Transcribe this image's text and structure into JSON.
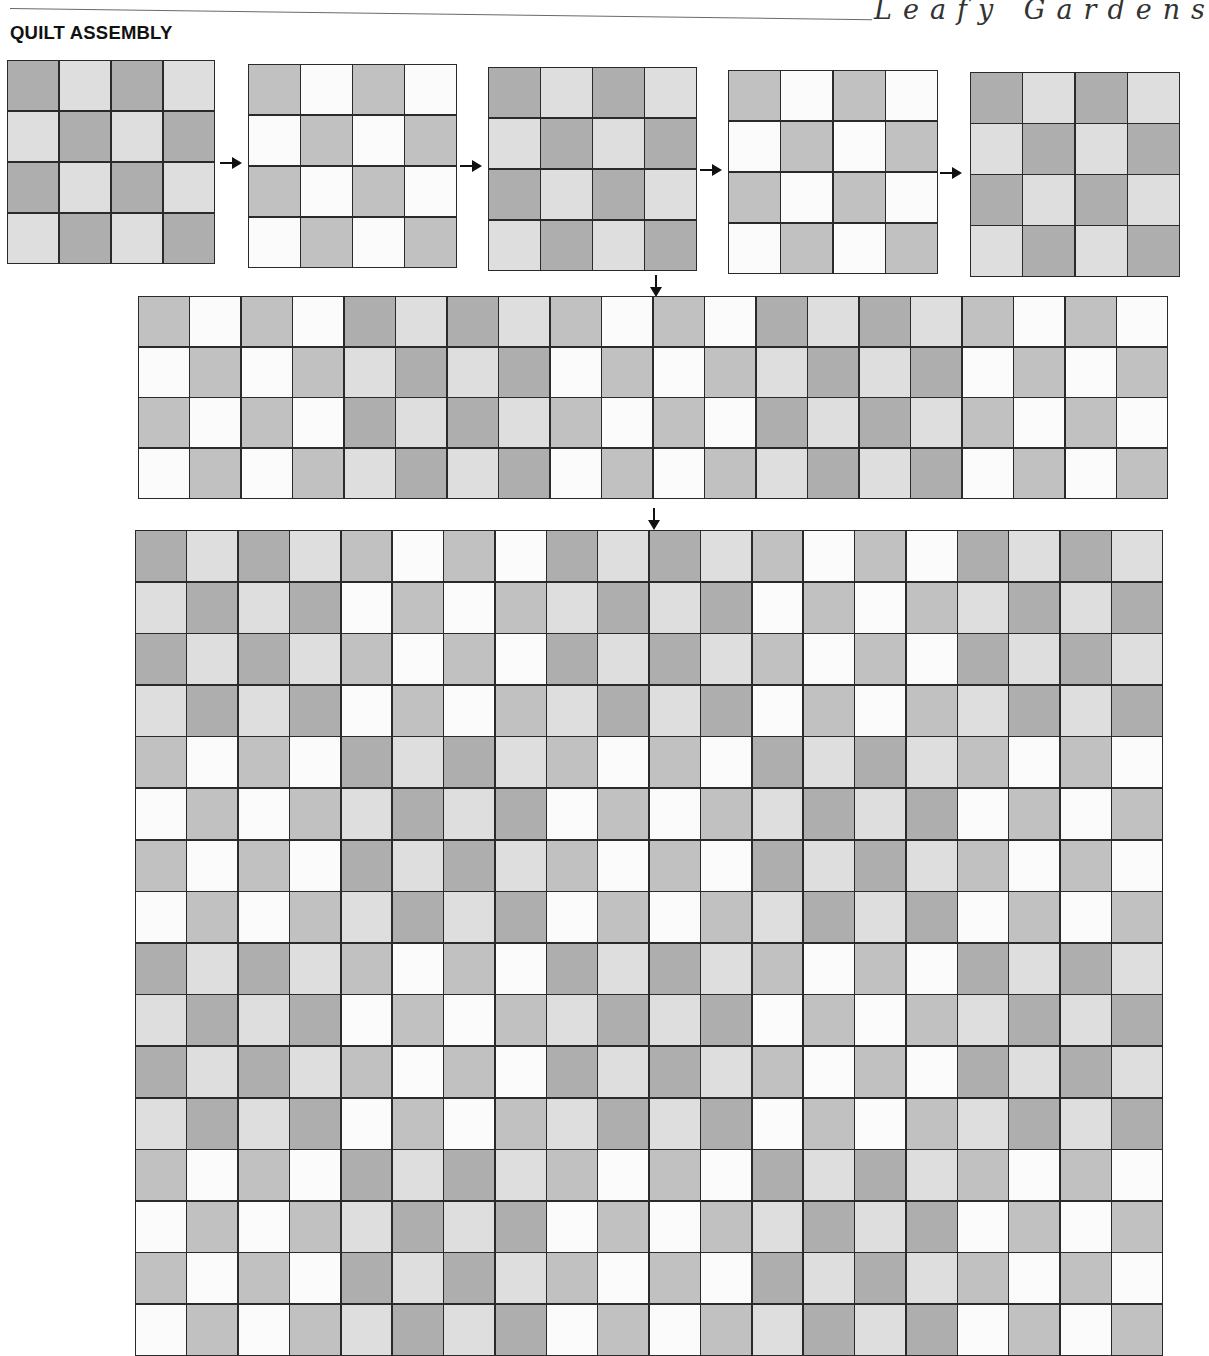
{
  "header": {
    "brand": "Leafy Gardens",
    "section_title": "QUILT ASSEMBLY"
  },
  "colors": {
    "D": "#aeaeae",
    "L": "#dedede",
    "M": "#c1c1c1",
    "W": "#fbfbfb",
    "seam": "#2a2a2a"
  },
  "block_patterns": {
    "A": [
      [
        "M",
        "W",
        "M",
        "W"
      ],
      [
        "W",
        "M",
        "W",
        "M"
      ],
      [
        "M",
        "W",
        "M",
        "W"
      ],
      [
        "W",
        "M",
        "W",
        "M"
      ]
    ],
    "B": [
      [
        "D",
        "L",
        "D",
        "L"
      ],
      [
        "L",
        "D",
        "L",
        "D"
      ],
      [
        "D",
        "L",
        "D",
        "L"
      ],
      [
        "L",
        "D",
        "L",
        "D"
      ]
    ]
  },
  "steps": {
    "blocks_row": {
      "label": "Row of 5 blocks",
      "sequence": [
        "B",
        "A",
        "B",
        "A",
        "B"
      ],
      "blocks": [
        {
          "x": 7,
          "y": 60,
          "w": 208,
          "h": 204
        },
        {
          "x": 248,
          "y": 64,
          "w": 209,
          "h": 204
        },
        {
          "x": 488,
          "y": 67,
          "w": 209,
          "h": 204
        },
        {
          "x": 728,
          "y": 70,
          "w": 210,
          "h": 204
        },
        {
          "x": 970,
          "y": 72,
          "w": 210,
          "h": 205
        }
      ],
      "arrows": [
        {
          "x": 220,
          "y": 157
        },
        {
          "x": 460,
          "y": 160
        },
        {
          "x": 700,
          "y": 164
        },
        {
          "x": 940,
          "y": 167
        }
      ]
    },
    "sewn_row": {
      "label": "Sewn row (20 × 4 cells)",
      "sequence": [
        "A",
        "B",
        "A",
        "B",
        "A"
      ],
      "x": 138,
      "y": 296,
      "w": 1030,
      "h": 203,
      "arrow_in": {
        "x": 650,
        "y": 275
      }
    },
    "quilt_top": {
      "label": "Assembled quilt (20 × 16 cells)",
      "block_rows": [
        [
          "B",
          "A",
          "B",
          "A",
          "B"
        ],
        [
          "A",
          "B",
          "A",
          "B",
          "A"
        ],
        [
          "B",
          "A",
          "B",
          "A",
          "B"
        ],
        [
          "A",
          "B",
          "A",
          "B",
          "A"
        ]
      ],
      "x": 135,
      "y": 530,
      "w": 1028,
      "h": 826,
      "arrow_in": {
        "x": 648,
        "y": 508
      }
    }
  }
}
